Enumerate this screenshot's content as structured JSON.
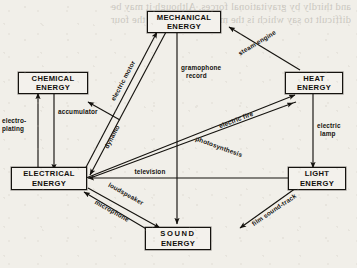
{
  "figure": {
    "kind": "energy-transformation-diagram",
    "ink_color": "#15130f",
    "paper_color": "#f1efe9"
  },
  "bleed_through": {
    "line1": "and thirdly by gravitational forces. Although it may be",
    "line2": "difficult to say which is the more important of the four",
    "line3": "branches of Physics, it is certainly important for us to know",
    "line4": "the food we eat and the amount figure in comparing the",
    "line5": "amount of energy values from nutrition to mass carrier."
  },
  "nodes": [
    {
      "id": "mechanical",
      "line1": "MECHANICAL",
      "line2": "ENERGY"
    },
    {
      "id": "chemical",
      "line1": "CHEMICAL",
      "line2": "ENERGY"
    },
    {
      "id": "heat",
      "line1": "HEAT",
      "line2": "ENERGY"
    },
    {
      "id": "electrical",
      "line1": "ELECTRICAL",
      "line2": "ENERGY"
    },
    {
      "id": "light",
      "line1": "LIGHT",
      "line2": "ENERGY"
    },
    {
      "id": "sound",
      "line1": "SOUND",
      "line2": "ENERGY"
    }
  ],
  "edges": [
    {
      "id": "steam-engine",
      "label": "steam engine",
      "from": "heat",
      "to": "mechanical"
    },
    {
      "id": "electric-motor",
      "label": "electric motor",
      "from": "electrical",
      "to": "mechanical"
    },
    {
      "id": "dynamo",
      "label": "dynamo",
      "from": "mechanical",
      "to": "electrical"
    },
    {
      "id": "gramophone-record",
      "label1": "gramophone",
      "label2": "record",
      "from": "mechanical",
      "to": "sound"
    },
    {
      "id": "accumulator",
      "label": "accumulator",
      "from": "chemical",
      "to": "electrical"
    },
    {
      "id": "electro-plating",
      "label1": "electro-",
      "label2": "plating",
      "from": "electrical",
      "to": "chemical"
    },
    {
      "id": "electric-fire",
      "label": "electric fire",
      "from": "electrical",
      "to": "heat"
    },
    {
      "id": "electric-lamp",
      "label1": "electric",
      "label2": "lamp",
      "from": "heat",
      "to": "light"
    },
    {
      "id": "photosynthesis",
      "label": "photosynthesis",
      "from": "light",
      "to": "chemical"
    },
    {
      "id": "television",
      "label": "television",
      "from": "light",
      "to": "electrical"
    },
    {
      "id": "loudspeaker",
      "label": "loudspeaker",
      "from": "electrical",
      "to": "sound"
    },
    {
      "id": "microphone",
      "label": "microphone",
      "from": "sound",
      "to": "electrical"
    },
    {
      "id": "film-sound-track",
      "label": "film sound-track",
      "from": "sound",
      "to": "light"
    }
  ]
}
